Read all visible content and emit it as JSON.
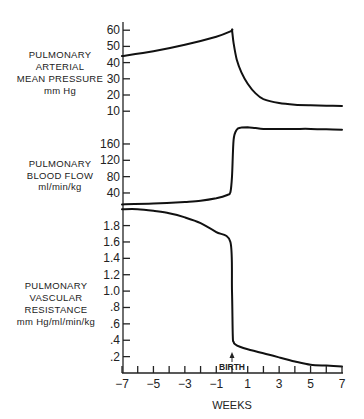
{
  "chart_data": [
    {
      "type": "line",
      "title": "",
      "panel_label": [
        "PULMONARY",
        "ARTERIAL",
        "MEAN PRESSURE",
        "mm Hg"
      ],
      "ylabel": "Pulmonary Arterial Mean Pressure (mm Hg)",
      "yticks": [
        10,
        20,
        30,
        40,
        50,
        60
      ],
      "ytick_labels": [
        "10",
        "20",
        "30",
        "40",
        "50",
        "60"
      ],
      "ylim": [
        0,
        60
      ],
      "x": [
        -7,
        -5,
        -3,
        -1,
        -0.05,
        0,
        0.1,
        0.3,
        0.6,
        1,
        1.5,
        2,
        3,
        4,
        5,
        6,
        7
      ],
      "values": [
        44,
        47,
        51,
        56,
        59.5,
        60,
        52,
        42,
        34,
        27,
        21,
        17.5,
        15,
        14,
        13.7,
        13.4,
        13.2
      ]
    },
    {
      "type": "line",
      "title": "",
      "panel_label": [
        "PULMONARY",
        "BLOOD FLOW",
        "ml/min/kg"
      ],
      "ylabel": "Pulmonary Blood Flow (ml/min/kg)",
      "yticks": [
        40,
        80,
        120,
        160
      ],
      "ytick_labels": [
        "40",
        "80",
        "120",
        "160"
      ],
      "ylim": [
        0,
        200
      ],
      "x": [
        -7,
        -5,
        -3,
        -2,
        -1,
        -0.3,
        -0.1,
        0,
        0.1,
        0.3,
        0.6,
        1,
        1.5,
        2,
        3,
        4,
        5,
        6,
        7
      ],
      "values": [
        12,
        14,
        18,
        21,
        27,
        35,
        42,
        80,
        170,
        195,
        200,
        201,
        199,
        197,
        197,
        197,
        197,
        196,
        195
      ]
    },
    {
      "type": "line",
      "title": "",
      "panel_label": [
        "PULMONARY",
        "VASCULAR",
        "RESISTANCE",
        "mm Hg/ml/min/kg"
      ],
      "ylabel": "Pulmonary Vascular Resistance (mm Hg/ml/min/kg)",
      "yticks": [
        0.2,
        0.4,
        0.6,
        0.8,
        1.0,
        1.2,
        1.4,
        1.6,
        1.8
      ],
      "ytick_labels": [
        ".2",
        ".4",
        ".6",
        ".8",
        "1.0",
        "1.2",
        "1.4",
        "1.6",
        "1.8"
      ],
      "ylim": [
        0,
        2.0
      ],
      "x": [
        -7,
        -6,
        -5,
        -4,
        -3,
        -2,
        -1,
        -0.1,
        0,
        0.05,
        0.1,
        0.2,
        0.5,
        1,
        2,
        3,
        4,
        5,
        6,
        7
      ],
      "values": [
        2.0,
        2.0,
        1.98,
        1.95,
        1.9,
        1.83,
        1.72,
        1.6,
        1.0,
        0.45,
        0.38,
        0.35,
        0.32,
        0.29,
        0.24,
        0.19,
        0.14,
        0.1,
        0.09,
        0.08
      ]
    }
  ],
  "xaxis": {
    "xlabel": "WEEKS",
    "xlim": [
      -7,
      7
    ],
    "xticks": [
      -7,
      -6,
      -5,
      -4,
      -3,
      -2,
      -1,
      0,
      1,
      2,
      3,
      4,
      5,
      6,
      7
    ],
    "xtick_labels": [
      {
        "value": -7,
        "label": "−7"
      },
      {
        "value": -5,
        "label": "−5"
      },
      {
        "value": -3,
        "label": "−3"
      },
      {
        "value": -1,
        "label": "−1"
      },
      {
        "value": 1,
        "label": "1"
      },
      {
        "value": 3,
        "label": "3"
      },
      {
        "value": 5,
        "label": "5"
      },
      {
        "value": 7,
        "label": "7"
      }
    ]
  },
  "annotation": {
    "label": "BIRTH",
    "x": 0,
    "arrow": "up-arrow-icon"
  }
}
